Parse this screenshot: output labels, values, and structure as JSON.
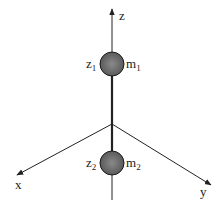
{
  "diagram": {
    "axes": {
      "z": {
        "label": "z"
      },
      "x": {
        "label": "x"
      },
      "y": {
        "label": "y"
      }
    },
    "masses": [
      {
        "position_label": "z",
        "position_sub": "1",
        "mass_label": "m",
        "mass_sub": "1"
      },
      {
        "position_label": "z",
        "position_sub": "2",
        "mass_label": "m",
        "mass_sub": "2"
      }
    ],
    "colors": {
      "line": "#222222",
      "ball": "#6e6e6e",
      "ball_edge": "#1a1a1a"
    }
  }
}
